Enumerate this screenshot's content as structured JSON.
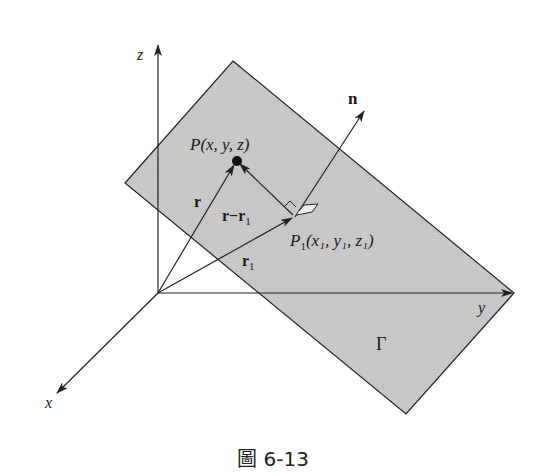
{
  "figure": {
    "caption": "圖 6-13",
    "colors": {
      "plane_fill": "#c8c8c8",
      "stroke": "#222222",
      "background": "#ffffff"
    },
    "axes": {
      "x_label": "x",
      "y_label": "y",
      "z_label": "z"
    },
    "plane": {
      "label": "Γ",
      "vertices": [
        [
          233,
          61
        ],
        [
          514,
          293
        ],
        [
          406,
          414
        ],
        [
          125,
          183
        ]
      ]
    },
    "points": {
      "P": {
        "label": "P(x, y, z)",
        "pos": [
          237,
          160
        ]
      },
      "P1": {
        "label_main": "P",
        "label_sub": "1",
        "label_rest": "(x₁, y₁, z₁)",
        "pos": [
          295,
          217
        ]
      }
    },
    "vectors": {
      "r": "r",
      "r1_main": "r",
      "r1_sub": "1",
      "r_minus_r1": "r−r",
      "r_minus_r1_sub": "1",
      "n": "n"
    }
  }
}
